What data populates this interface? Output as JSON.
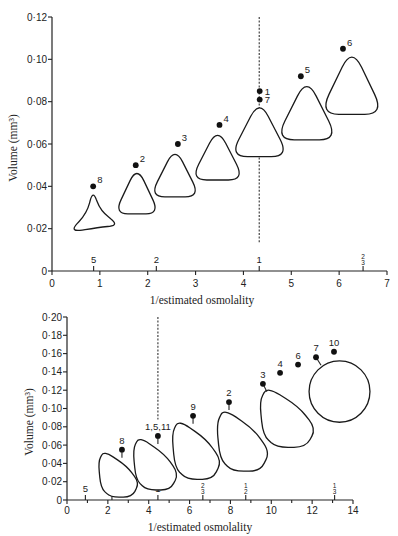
{
  "chart_data": [
    {
      "type": "scatter",
      "title": "",
      "xlabel": "1/estimated osmolality",
      "ylabel": "Volume (mm³)",
      "xlim": [
        0,
        7
      ],
      "ylim": [
        0,
        0.12
      ],
      "grid": false,
      "legend": null,
      "x_ticks": [
        {
          "v": 0,
          "label": "0"
        },
        {
          "v": 1,
          "label": "1"
        },
        {
          "v": 2,
          "label": "2"
        },
        {
          "v": 3,
          "label": "3"
        },
        {
          "v": 4,
          "label": "4"
        },
        {
          "v": 5,
          "label": "5"
        },
        {
          "v": 6,
          "label": "6"
        },
        {
          "v": 7,
          "label": "7"
        }
      ],
      "x_minor_ticks": [],
      "y_ticks": [
        {
          "v": 0,
          "label": "0"
        },
        {
          "v": 0.02,
          "label": "0·02"
        },
        {
          "v": 0.04,
          "label": "0·04"
        },
        {
          "v": 0.06,
          "label": "0·06"
        },
        {
          "v": 0.08,
          "label": "0·08"
        },
        {
          "v": 0.1,
          "label": "0·10"
        },
        {
          "v": 0.12,
          "label": "0·12"
        }
      ],
      "reference_line": {
        "x": 4.33,
        "y_from": 0.013,
        "y_to": 0.12,
        "style": "dashed"
      },
      "axis_markers": [
        {
          "x": 0.87,
          "label": "5"
        },
        {
          "x": 2.18,
          "label": "2"
        },
        {
          "x": 4.33,
          "label": "1"
        },
        {
          "x": 6.5,
          "label": "2/3"
        }
      ],
      "points": [
        {
          "label": "8",
          "x": 0.86,
          "y": 0.04,
          "label_pos": "upper-right"
        },
        {
          "label": "2",
          "x": 1.75,
          "y": 0.05,
          "label_pos": "upper-right"
        },
        {
          "label": "3",
          "x": 2.63,
          "y": 0.06,
          "label_pos": "upper-right"
        },
        {
          "label": "4",
          "x": 3.5,
          "y": 0.069,
          "label_pos": "upper-right"
        },
        {
          "label": "1",
          "x": 4.34,
          "y": 0.085,
          "label_pos": "right"
        },
        {
          "label": "7",
          "x": 4.34,
          "y": 0.081,
          "label_pos": "right"
        },
        {
          "label": "5",
          "x": 5.2,
          "y": 0.092,
          "label_pos": "upper-right"
        },
        {
          "label": "6",
          "x": 6.08,
          "y": 0.105,
          "label_pos": "upper-right"
        }
      ],
      "cells": [
        {
          "for": "8",
          "shape": "trilobed",
          "bbox": [
            0.46,
            0.018,
            1.3,
            0.036
          ]
        },
        {
          "for": "2",
          "shape": "rounded-triangle",
          "bbox": [
            1.38,
            0.027,
            2.17,
            0.046
          ]
        },
        {
          "for": "3",
          "shape": "rounded-triangle",
          "bbox": [
            2.13,
            0.035,
            3.01,
            0.055
          ]
        },
        {
          "for": "4",
          "shape": "rounded-triangle",
          "bbox": [
            2.99,
            0.043,
            3.93,
            0.064
          ]
        },
        {
          "for": "1,7",
          "shape": "rounded-triangle",
          "bbox": [
            3.82,
            0.054,
            4.85,
            0.077
          ]
        },
        {
          "for": "5",
          "shape": "rounded-triangle",
          "bbox": [
            4.78,
            0.062,
            5.87,
            0.087
          ]
        },
        {
          "for": "6",
          "shape": "rounded-triangle",
          "bbox": [
            5.7,
            0.074,
            6.83,
            0.101
          ]
        }
      ]
    },
    {
      "type": "scatter",
      "title": "",
      "xlabel": "1/estimated osmolality",
      "ylabel": "Volume (mm³)",
      "xlim": [
        0,
        14
      ],
      "ylim": [
        0,
        0.2
      ],
      "grid": false,
      "legend": null,
      "x_ticks": [
        {
          "v": 0,
          "label": "0"
        },
        {
          "v": 2,
          "label": "2"
        },
        {
          "v": 4,
          "label": "4"
        },
        {
          "v": 6,
          "label": "6"
        },
        {
          "v": 8,
          "label": "8"
        },
        {
          "v": 10,
          "label": "10"
        },
        {
          "v": 12,
          "label": "12"
        },
        {
          "v": 14,
          "label": "14"
        }
      ],
      "x_minor_ticks": [
        1,
        3,
        5,
        7,
        9,
        11,
        13
      ],
      "y_ticks": [
        {
          "v": 0,
          "label": "0"
        },
        {
          "v": 0.02,
          "label": "0·02"
        },
        {
          "v": 0.04,
          "label": "0·04"
        },
        {
          "v": 0.06,
          "label": "0·06"
        },
        {
          "v": 0.08,
          "label": "0·08"
        },
        {
          "v": 0.1,
          "label": "0·10"
        },
        {
          "v": 0.12,
          "label": "0·12"
        },
        {
          "v": 0.14,
          "label": "0·14"
        },
        {
          "v": 0.16,
          "label": "0·16"
        },
        {
          "v": 0.18,
          "label": "0·18"
        },
        {
          "v": 0.2,
          "label": "0·20"
        }
      ],
      "reference_line": {
        "x": 4.45,
        "y_from": 0.088,
        "y_to": 0.2,
        "style": "dashed"
      },
      "axis_markers": [
        {
          "x": 0.9,
          "label": "5"
        },
        {
          "x": 2.2,
          "label": "2"
        },
        {
          "x": 4.45,
          "label": "1"
        },
        {
          "x": 6.65,
          "label": "2/3"
        },
        {
          "x": 8.75,
          "label": "1/2"
        },
        {
          "x": 13.1,
          "label": "1/3"
        }
      ],
      "points": [
        {
          "label": "8",
          "x": 2.69,
          "y": 0.055,
          "label_pos": "above",
          "stem": 0
        },
        {
          "label": "1,5,11",
          "x": 4.45,
          "y": 0.07,
          "label_pos": "above",
          "stem": 0
        },
        {
          "label": "9",
          "x": 6.17,
          "y": 0.092,
          "label_pos": "above",
          "stem": 0
        },
        {
          "label": "2",
          "x": 7.93,
          "y": 0.107,
          "label_pos": "above",
          "stem": 0
        },
        {
          "label": "3",
          "x": 9.59,
          "y": 0.127,
          "label_pos": "above",
          "stem": 4
        },
        {
          "label": "4",
          "x": 10.43,
          "y": 0.139,
          "label_pos": "above"
        },
        {
          "label": "6",
          "x": 11.31,
          "y": 0.148,
          "label_pos": "above"
        },
        {
          "label": "7",
          "x": 12.19,
          "y": 0.156,
          "label_pos": "above",
          "stem": 5
        },
        {
          "label": "10",
          "x": 13.07,
          "y": 0.162,
          "label_pos": "above"
        }
      ],
      "cells": [
        {
          "for": "8",
          "shape": "irregular",
          "bbox": [
            1.62,
            0.005,
            3.43,
            0.051
          ]
        },
        {
          "for": "1,5,11",
          "shape": "irregular",
          "bbox": [
            3.33,
            0.013,
            5.34,
            0.066
          ]
        },
        {
          "for": "9",
          "shape": "irregular",
          "bbox": [
            5.24,
            0.025,
            7.44,
            0.084
          ]
        },
        {
          "for": "2",
          "shape": "irregular",
          "bbox": [
            7.44,
            0.034,
            9.79,
            0.096
          ]
        },
        {
          "for": "3",
          "shape": "irregular",
          "bbox": [
            9.55,
            0.06,
            12.04,
            0.12
          ]
        },
        {
          "for": "7,10",
          "shape": "circle",
          "bbox": [
            11.85,
            0.085,
            14.83,
            0.152
          ]
        }
      ]
    }
  ]
}
